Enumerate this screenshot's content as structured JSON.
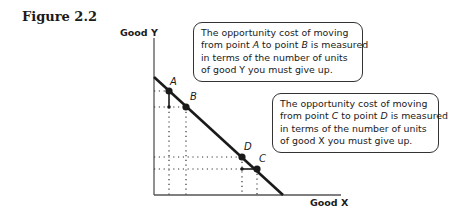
{
  "figure": {
    "title": "Figure 2.2"
  },
  "axes": {
    "y_label": "Good Y",
    "x_label": "Good X"
  },
  "points": [
    {
      "id": "A",
      "label": "A",
      "x": 169,
      "y": 91
    },
    {
      "id": "B",
      "label": "B",
      "x": 186,
      "y": 107
    },
    {
      "id": "D",
      "label": "D",
      "x": 242,
      "y": 157
    },
    {
      "id": "C",
      "label": "C",
      "x": 257,
      "y": 169
    }
  ],
  "callouts": {
    "ab": {
      "line1": "The opportunity cost of moving",
      "line2_pre": "from point ",
      "line2_p1": "A",
      "line2_mid": " to point ",
      "line2_p2": "B",
      "line2_post": " is measured",
      "line3": "in terms of the number of units",
      "line4": "of good Y you must give up."
    },
    "cd": {
      "line1": "The opportunity cost of moving",
      "line2_pre": "from point ",
      "line2_p1": "C",
      "line2_mid": " to point ",
      "line2_p2": "D",
      "line2_post": " is measured",
      "line3": "in terms of the number of units",
      "line4": "of good X you must give up."
    }
  },
  "colors": {
    "ink": "#1a1a1a",
    "axis": "#555555",
    "background": "#ffffff"
  }
}
